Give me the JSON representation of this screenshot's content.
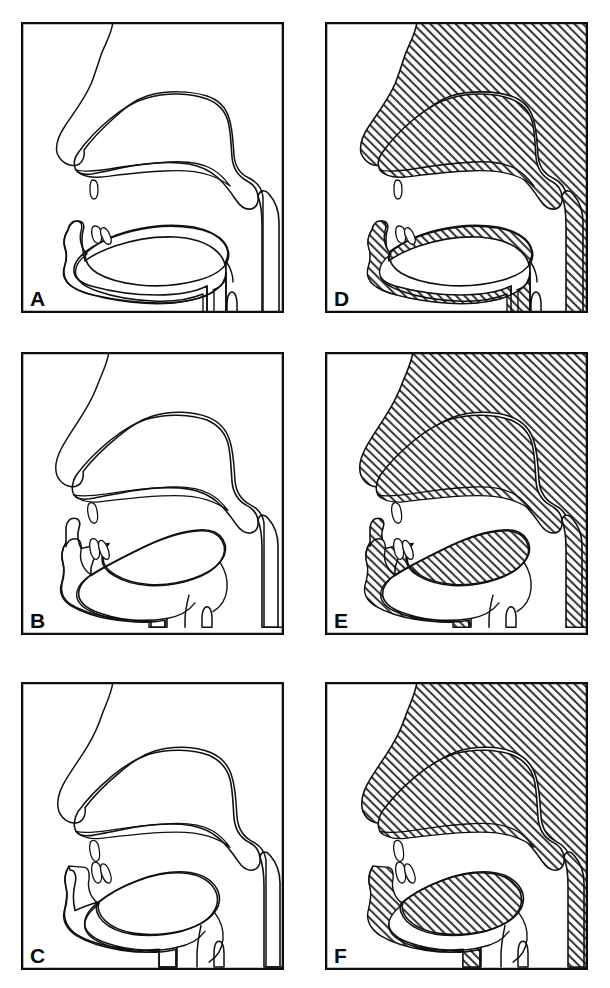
{
  "figure": {
    "kind": "midsagittal-vocal-tract-diagram-grid",
    "columns": 2,
    "rows": 3,
    "line_color": "#111111",
    "frame_color": "#0d0d0d",
    "background_color": "#ffffff",
    "hatch_color": "#3a3a3a",
    "tissue_fill_style": "diagonal-hatch-45deg",
    "airway_fill_color": "#ffffff"
  },
  "panels": [
    {
      "label": "A",
      "column": "left",
      "row": 1,
      "style": "outline",
      "shaded": false,
      "x": 21,
      "y": 22,
      "w": 263,
      "h": 291,
      "posture": "low-flat-tongue-open-jaw",
      "anatomy": [
        "nasal-profile",
        "hard-palate",
        "velum",
        "uvula",
        "upper-teeth",
        "lower-teeth",
        "tongue-body",
        "tongue-tip",
        "mandible",
        "pharyngeal-wall",
        "epiglottis",
        "larynx",
        "trachea"
      ]
    },
    {
      "label": "D",
      "column": "right",
      "row": 1,
      "style": "hatched",
      "shaded": true,
      "x": 325,
      "y": 22,
      "w": 263,
      "h": 291,
      "posture": "low-flat-tongue-open-jaw",
      "anatomy": [
        "nasal-profile",
        "hard-palate",
        "velum",
        "uvula",
        "upper-teeth",
        "lower-teeth",
        "tongue-body",
        "tongue-tip",
        "mandible",
        "pharyngeal-wall",
        "epiglottis",
        "larynx",
        "trachea"
      ]
    },
    {
      "label": "B",
      "column": "left",
      "row": 2,
      "style": "outline",
      "shaded": false,
      "x": 21,
      "y": 352,
      "w": 263,
      "h": 283,
      "posture": "high-back-tongue-narrow-pharynx",
      "anatomy": [
        "nasal-profile",
        "hard-palate",
        "velum",
        "uvula",
        "upper-teeth",
        "lower-teeth",
        "tongue-body",
        "tongue-tip",
        "mandible",
        "pharyngeal-wall",
        "epiglottis",
        "larynx",
        "trachea"
      ]
    },
    {
      "label": "E",
      "column": "right",
      "row": 2,
      "style": "hatched",
      "shaded": true,
      "x": 325,
      "y": 352,
      "w": 263,
      "h": 283,
      "posture": "high-back-tongue-narrow-pharynx",
      "anatomy": [
        "nasal-profile",
        "hard-palate",
        "velum",
        "uvula",
        "upper-teeth",
        "lower-teeth",
        "tongue-body",
        "tongue-tip",
        "mandible",
        "pharyngeal-wall",
        "epiglottis",
        "larynx",
        "trachea"
      ]
    },
    {
      "label": "C",
      "column": "left",
      "row": 3,
      "style": "outline",
      "shaded": false,
      "x": 21,
      "y": 682,
      "w": 263,
      "h": 288,
      "posture": "bunched-front-tongue-close-jaw",
      "anatomy": [
        "nasal-profile",
        "hard-palate",
        "velum",
        "uvula",
        "upper-teeth",
        "lower-teeth",
        "tongue-body",
        "tongue-tip",
        "mandible",
        "pharyngeal-wall",
        "epiglottis",
        "larynx",
        "trachea"
      ]
    },
    {
      "label": "F",
      "column": "right",
      "row": 3,
      "style": "hatched",
      "shaded": true,
      "x": 325,
      "y": 682,
      "w": 263,
      "h": 288,
      "posture": "bunched-front-tongue-close-jaw",
      "anatomy": [
        "nasal-profile",
        "hard-palate",
        "velum",
        "uvula",
        "upper-teeth",
        "lower-teeth",
        "tongue-body",
        "tongue-tip",
        "mandible",
        "pharyngeal-wall",
        "epiglottis",
        "larynx",
        "trachea"
      ]
    }
  ]
}
